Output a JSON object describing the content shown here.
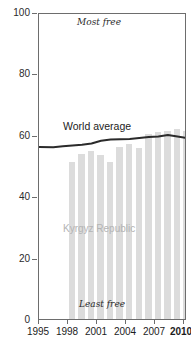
{
  "chart_data": {
    "type": "bar",
    "title": "",
    "subtitle": "",
    "xlabel": "",
    "ylabel": "",
    "xlim": [
      1995,
      2010.5
    ],
    "ylim": [
      0,
      100
    ],
    "grid": false,
    "legend_position": "inline-annotation",
    "y_ticks": [
      0,
      20,
      40,
      60,
      80,
      100
    ],
    "y_tick_labels": [
      "0",
      "20",
      "40",
      "60",
      "80",
      "100"
    ],
    "x_ticks": [
      1995,
      1998,
      2001,
      2004,
      2007,
      2010
    ],
    "x_tick_labels": [
      "1995",
      "1998",
      "2001",
      "2004",
      "2007",
      "2010"
    ],
    "annotations": [
      {
        "text": "Most free",
        "x": 2002,
        "y": 97,
        "style": "italic"
      },
      {
        "text": "Least free",
        "x": 2002,
        "y": 3,
        "style": "italic"
      },
      {
        "text": "Kyrgyz Republic",
        "x": 2002.5,
        "y": 32,
        "style": "series-label"
      },
      {
        "text": "World average",
        "x": 2001,
        "y": 66,
        "style": "series-label"
      }
    ],
    "series": [
      {
        "name": "Kyrgyz Republic",
        "type": "bar",
        "color": "#dcdcdc",
        "x": [
          1998,
          1999,
          2000,
          2001,
          2002,
          2003,
          2004,
          2005,
          2006,
          2007,
          2008,
          2009,
          2010
        ],
        "values": [
          51.0,
          53.6,
          54.7,
          53.3,
          51.1,
          56.0,
          57.0,
          55.7,
          60.2,
          60.9,
          61.1,
          61.8,
          61.1
        ]
      },
      {
        "name": "World average",
        "type": "line",
        "color": "#2b2b2b",
        "x": [
          1995,
          1996,
          1997,
          1998,
          1999,
          2000,
          2001,
          2002,
          2003,
          2004,
          2005,
          2006,
          2007,
          2008,
          2009,
          2010
        ],
        "values": [
          56.7,
          56.6,
          56.9,
          57.2,
          57.4,
          57.8,
          58.7,
          59.1,
          59.2,
          59.3,
          59.6,
          59.9,
          60.1,
          60.6,
          60.1,
          59.6
        ]
      }
    ]
  },
  "axis": {
    "y_labels": [
      "100",
      "80",
      "60",
      "40",
      "20",
      "0"
    ],
    "x_labels": [
      "1995",
      "1998",
      "2001",
      "2004",
      "2007",
      "2010"
    ]
  },
  "labels": {
    "most_free": "Most free",
    "least_free": "Least free",
    "country_series": "Kyrgyz Republic",
    "world_series": "World average"
  },
  "colors": {
    "bar": "#dcdcdc",
    "line": "#2b2b2b",
    "axis": "#6d6d6d",
    "text": "#1c1c1c",
    "muted_text": "#b4b4b4"
  }
}
